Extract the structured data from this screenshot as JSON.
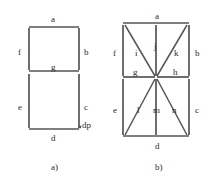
{
  "image": {
    "kind": "technical-line-drawing",
    "subject": "seven-segment and fourteen-segment display segment naming diagrams",
    "width_px": 209,
    "height_px": 185,
    "background_color": "#ffffff",
    "stroke_color": "#555555",
    "text_color": "#2b2b2b"
  },
  "figures": [
    {
      "id": "figure-a",
      "caption": "a)",
      "caption_x": 51,
      "caption_y": 163,
      "description": "seven-segment display with decimal point",
      "segment_count": 7,
      "has_decimal_point": true,
      "bounds": {
        "x": 28,
        "y": 26,
        "width": 51,
        "height": 104
      },
      "labels": [
        {
          "name": "a",
          "text": "a",
          "x": 51,
          "y": 15,
          "role": "top-segment"
        },
        {
          "name": "f",
          "text": "f",
          "x": 18,
          "y": 48,
          "role": "upper-left-segment"
        },
        {
          "name": "b",
          "text": "b",
          "x": 84,
          "y": 48,
          "role": "upper-right-segment"
        },
        {
          "name": "g",
          "text": "g",
          "x": 51,
          "y": 63,
          "role": "middle-segment"
        },
        {
          "name": "e",
          "text": "e",
          "x": 18,
          "y": 103,
          "role": "lower-left-segment"
        },
        {
          "name": "c",
          "text": "c",
          "x": 84,
          "y": 103,
          "role": "lower-right-segment"
        },
        {
          "name": "d",
          "text": "d",
          "x": 51,
          "y": 134,
          "role": "bottom-segment"
        },
        {
          "name": "dp",
          "text": "dp",
          "x": 82,
          "y": 121,
          "role": "decimal-point"
        }
      ],
      "segments": [
        {
          "name": "a",
          "type": "horizontal",
          "x1": 29,
          "y1": 27,
          "x2": 79,
          "y2": 27
        },
        {
          "name": "f",
          "type": "vertical",
          "x1": 29,
          "y1": 28,
          "x2": 29,
          "y2": 70
        },
        {
          "name": "b",
          "type": "vertical",
          "x1": 79,
          "y1": 28,
          "x2": 79,
          "y2": 70
        },
        {
          "name": "g",
          "type": "horizontal",
          "x1": 29,
          "y1": 71,
          "x2": 79,
          "y2": 71
        },
        {
          "name": "e",
          "type": "vertical",
          "x1": 29,
          "y1": 74,
          "x2": 29,
          "y2": 128
        },
        {
          "name": "c",
          "type": "vertical",
          "x1": 79,
          "y1": 74,
          "x2": 79,
          "y2": 128
        },
        {
          "name": "d",
          "type": "horizontal",
          "x1": 29,
          "y1": 129,
          "x2": 79,
          "y2": 129
        }
      ],
      "decimal_point": {
        "cx": 80,
        "cy": 127,
        "r": 1.4
      }
    },
    {
      "id": "figure-b",
      "caption": "b)",
      "caption_x": 155,
      "caption_y": 163,
      "description": "fourteen-segment starburst display",
      "segment_count": 14,
      "has_decimal_point": false,
      "bounds": {
        "x": 122,
        "y": 23,
        "width": 68,
        "height": 117
      },
      "labels": [
        {
          "name": "a",
          "text": "a",
          "x": 155,
          "y": 12,
          "role": "top-segment"
        },
        {
          "name": "f",
          "text": "f",
          "x": 113,
          "y": 49,
          "role": "upper-left-segment"
        },
        {
          "name": "i",
          "text": "i",
          "x": 135,
          "y": 49,
          "role": "upper-left-diagonal"
        },
        {
          "name": "j",
          "text": "j",
          "x": 154,
          "y": 42,
          "role": "upper-center-vertical"
        },
        {
          "name": "k",
          "text": "k",
          "x": 174,
          "y": 49,
          "role": "upper-right-diagonal"
        },
        {
          "name": "b",
          "text": "b",
          "x": 195,
          "y": 49,
          "role": "upper-right-segment"
        },
        {
          "name": "g",
          "text": "g",
          "x": 133,
          "y": 68,
          "role": "middle-left-segment"
        },
        {
          "name": "h",
          "text": "h",
          "x": 173,
          "y": 68,
          "role": "middle-right-segment"
        },
        {
          "name": "e",
          "text": "e",
          "x": 113,
          "y": 106,
          "role": "lower-left-segment"
        },
        {
          "name": "l",
          "text": "l",
          "x": 137,
          "y": 106,
          "role": "lower-left-diagonal"
        },
        {
          "name": "m",
          "text": "m",
          "x": 153,
          "y": 106,
          "role": "lower-center-vertical"
        },
        {
          "name": "n",
          "text": "n",
          "x": 172,
          "y": 106,
          "role": "lower-right-diagonal"
        },
        {
          "name": "c",
          "text": "c",
          "x": 195,
          "y": 106,
          "role": "lower-right-segment"
        },
        {
          "name": "d",
          "text": "d",
          "x": 155,
          "y": 142,
          "role": "bottom-segment"
        }
      ],
      "segments": [
        {
          "name": "a",
          "type": "horizontal",
          "x1": 123,
          "y1": 23,
          "x2": 189,
          "y2": 23
        },
        {
          "name": "f",
          "type": "vertical",
          "x1": 123,
          "y1": 25,
          "x2": 123,
          "y2": 76
        },
        {
          "name": "b",
          "type": "vertical",
          "x1": 189,
          "y1": 25,
          "x2": 189,
          "y2": 76
        },
        {
          "name": "i",
          "type": "diagonal",
          "x1": 125,
          "y1": 25,
          "x2": 155,
          "y2": 76
        },
        {
          "name": "j",
          "type": "vertical",
          "x1": 156,
          "y1": 25,
          "x2": 156,
          "y2": 76
        },
        {
          "name": "k",
          "type": "diagonal",
          "x1": 187,
          "y1": 25,
          "x2": 157,
          "y2": 76
        },
        {
          "name": "g",
          "type": "horizontal",
          "x1": 123,
          "y1": 77,
          "x2": 155,
          "y2": 77
        },
        {
          "name": "h",
          "type": "horizontal",
          "x1": 157,
          "y1": 77,
          "x2": 189,
          "y2": 77
        },
        {
          "name": "e",
          "type": "vertical",
          "x1": 123,
          "y1": 79,
          "x2": 123,
          "y2": 135
        },
        {
          "name": "l",
          "type": "diagonal",
          "x1": 125,
          "y1": 135,
          "x2": 155,
          "y2": 79
        },
        {
          "name": "m",
          "type": "vertical",
          "x1": 156,
          "y1": 79,
          "x2": 156,
          "y2": 135
        },
        {
          "name": "n",
          "type": "diagonal",
          "x1": 157,
          "y1": 79,
          "x2": 187,
          "y2": 135
        },
        {
          "name": "c",
          "type": "vertical",
          "x1": 189,
          "y1": 79,
          "x2": 189,
          "y2": 135
        },
        {
          "name": "d",
          "type": "horizontal",
          "x1": 123,
          "y1": 136,
          "x2": 189,
          "y2": 136
        }
      ],
      "decimal_point": null
    }
  ]
}
